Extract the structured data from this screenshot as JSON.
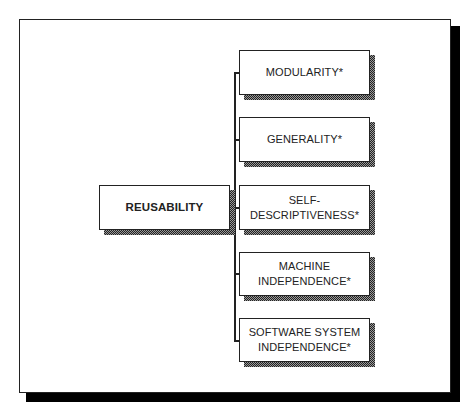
{
  "diagram": {
    "type": "hierarchy",
    "root": {
      "label": "REUSABILITY"
    },
    "children": [
      {
        "label": "MODULARITY*"
      },
      {
        "label": "GENERALITY*"
      },
      {
        "label": "SELF-\nDESCRIPTIVENESS*",
        "line1": "SELF-",
        "line2": "DESCRIPTIVENESS*"
      },
      {
        "label": "MACHINE INDEPENDENCE*",
        "line1": "MACHINE",
        "line2": "INDEPENDENCE*"
      },
      {
        "label": "SOFTWARE SYSTEM INDEPENDENCE*",
        "line1": "SOFTWARE SYSTEM",
        "line2": "INDEPENDENCE*"
      }
    ]
  },
  "colors": {
    "line": "#222222",
    "frame_shadow": "#000000",
    "box_shadow": "#666666",
    "background": "#ffffff"
  }
}
